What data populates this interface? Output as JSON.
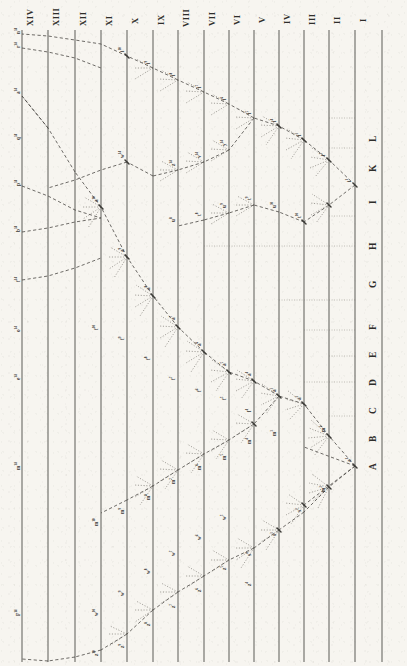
{
  "plate": {
    "title": "Diagram of Divergence of Taxa",
    "orientation": "rotated-90-counterclockwise",
    "paper_color": "#f7f5f0",
    "ink_color": "#3b3a36"
  },
  "strata": {
    "axis_label": "Geological formations",
    "numerals": [
      "XIV",
      "XIII",
      "XII",
      "XI",
      "X",
      "IX",
      "VIII",
      "VII",
      "VI",
      "V",
      "IV",
      "III",
      "II",
      "I"
    ]
  },
  "species": {
    "axis_label": "Original species",
    "letters": [
      "A",
      "B",
      "C",
      "D",
      "E",
      "F",
      "G",
      "H",
      "I",
      "K",
      "L"
    ]
  },
  "chart_data": {
    "type": "diagram",
    "xlabel": "Geological formations",
    "ylabel": "Original species",
    "strata": [
      "XIV",
      "XIII",
      "XII",
      "XI",
      "X",
      "IX",
      "VIII",
      "VII",
      "VI",
      "V",
      "IV",
      "III",
      "II",
      "I"
    ],
    "roots": [
      "A",
      "B",
      "C",
      "D",
      "E",
      "F",
      "G",
      "H",
      "I",
      "K",
      "L"
    ],
    "diverging_roots": [
      "A",
      "I"
    ],
    "persisting_roots": [
      "F"
    ],
    "extinct_roots": [
      "B",
      "C",
      "D",
      "E",
      "G",
      "H",
      "K",
      "L"
    ],
    "lineage_A_labels": [
      "a1",
      "m1",
      "a2",
      "m2",
      "s2",
      "a3",
      "m3",
      "s3",
      "a4",
      "l4",
      "m4",
      "s4",
      "z4",
      "a5",
      "f5",
      "m5",
      "w5",
      "z5",
      "a6",
      "f6",
      "m6",
      "w6",
      "z6",
      "a7",
      "f7",
      "m7",
      "w7",
      "z7",
      "a8",
      "f8",
      "m8",
      "w8",
      "z8",
      "a9",
      "f9",
      "m9",
      "w9",
      "z9",
      "a10",
      "f10",
      "m10",
      "w10",
      "z10",
      "a14",
      "q14",
      "p14",
      "b14",
      "f14",
      "o14",
      "e14",
      "m14",
      "F14"
    ],
    "lineage_I_labels": [
      "i1",
      "i2",
      "i3",
      "i4",
      "i5",
      "i6",
      "i7",
      "i8",
      "i9",
      "i10",
      "n14",
      "r14",
      "w14",
      "y14",
      "v14",
      "z14",
      "u8",
      "t8",
      "u9",
      "t9",
      "u10",
      "t10"
    ]
  }
}
